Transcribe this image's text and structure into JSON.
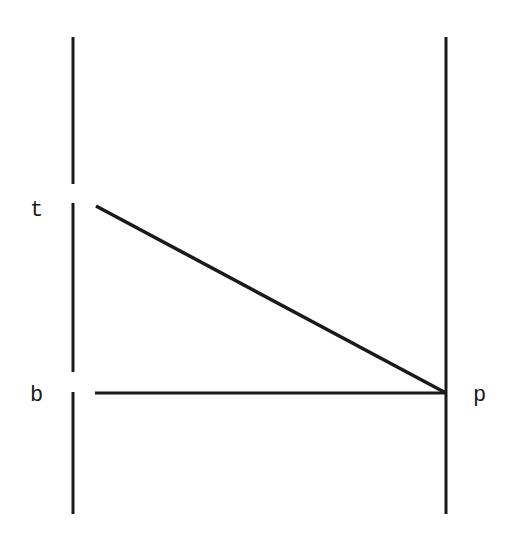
{
  "diagram": {
    "labels": {
      "t": "t",
      "b": "b",
      "p": "p"
    },
    "colors": {
      "stroke": "#1a1a1a",
      "background": "#ffffff"
    },
    "elements": [
      {
        "type": "vertical-line",
        "name": "left-line",
        "x": 73,
        "segments": [
          [
            37,
            184
          ],
          [
            203,
            372
          ],
          [
            392,
            514
          ]
        ]
      },
      {
        "type": "vertical-line",
        "name": "right-line",
        "x": 446,
        "segments": [
          [
            37,
            514
          ]
        ]
      },
      {
        "type": "line",
        "name": "diagonal-line",
        "from": [
          96,
          206
        ],
        "to": [
          446,
          393
        ]
      },
      {
        "type": "line",
        "name": "horizontal-line",
        "from": [
          95,
          393
        ],
        "to": [
          446,
          393
        ]
      }
    ]
  }
}
